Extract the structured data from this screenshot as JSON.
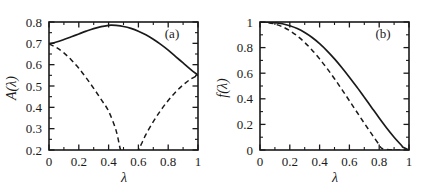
{
  "figure": {
    "panels": [
      "a",
      "b"
    ],
    "line_color": "#1a1a1a",
    "background": "#ffffff"
  },
  "panel_a": {
    "tag": "(a)",
    "xlabel": "λ",
    "ylabel": "A(λ)",
    "xticks": [
      "0",
      "0.2",
      "0.4",
      "0.6",
      "0.8",
      "1"
    ],
    "yticks": [
      "0.2",
      "0.3",
      "0.4",
      "0.5",
      "0.6",
      "0.7",
      "0.8"
    ]
  },
  "panel_b": {
    "tag": "(b)",
    "xlabel": "λ",
    "ylabel": "f(λ)",
    "xticks": [
      "0",
      "0.2",
      "0.4",
      "0.6",
      "0.8",
      "1"
    ],
    "yticks": [
      "0",
      "0.2",
      "0.4",
      "0.6",
      "0.8",
      "1"
    ]
  },
  "chart_data": [
    {
      "type": "line",
      "title": "(a)",
      "xlabel": "λ",
      "ylabel": "A(λ)",
      "xlim": [
        0,
        1
      ],
      "ylim": [
        0.2,
        0.8
      ],
      "xticks": [
        0,
        0.2,
        0.4,
        0.6,
        0.8,
        1
      ],
      "yticks": [
        0.2,
        0.3,
        0.4,
        0.5,
        0.6,
        0.7,
        0.8
      ],
      "grid": false,
      "legend": "none",
      "series": [
        {
          "name": "solid",
          "style": "solid",
          "x": [
            0,
            0.05,
            0.1,
            0.15,
            0.2,
            0.25,
            0.3,
            0.35,
            0.4,
            0.42,
            0.45,
            0.5,
            0.55,
            0.6,
            0.65,
            0.7,
            0.75,
            0.8,
            0.85,
            0.9,
            0.95,
            1
          ],
          "y": [
            0.697,
            0.706,
            0.718,
            0.731,
            0.744,
            0.757,
            0.769,
            0.778,
            0.784,
            0.785,
            0.784,
            0.779,
            0.77,
            0.757,
            0.74,
            0.719,
            0.695,
            0.668,
            0.638,
            0.608,
            0.578,
            0.551
          ]
        },
        {
          "name": "dashed",
          "style": "dashed",
          "note": "clipped below axis minimum between lambda 0.48 and 0.60",
          "x": [
            0,
            0.05,
            0.1,
            0.15,
            0.2,
            0.25,
            0.3,
            0.35,
            0.4,
            0.45,
            0.48,
            0.5,
            0.54,
            0.6,
            0.62,
            0.65,
            0.7,
            0.75,
            0.8,
            0.85,
            0.9,
            0.95,
            1
          ],
          "y": [
            0.697,
            0.68,
            0.655,
            0.622,
            0.583,
            0.538,
            0.489,
            0.437,
            0.382,
            0.292,
            0.2,
            0.175,
            0.165,
            0.2,
            0.228,
            0.272,
            0.333,
            0.386,
            0.432,
            0.472,
            0.505,
            0.532,
            0.551
          ]
        }
      ]
    },
    {
      "type": "line",
      "title": "(b)",
      "xlabel": "λ",
      "ylabel": "f(λ)",
      "xlim": [
        0,
        1
      ],
      "ylim": [
        0,
        1
      ],
      "xticks": [
        0,
        0.2,
        0.4,
        0.6,
        0.8,
        1
      ],
      "yticks": [
        0,
        0.2,
        0.4,
        0.6,
        0.8,
        1
      ],
      "grid": false,
      "legend": "none",
      "series": [
        {
          "name": "solid",
          "style": "solid",
          "x": [
            0,
            0.05,
            0.1,
            0.15,
            0.2,
            0.25,
            0.3,
            0.35,
            0.4,
            0.45,
            0.5,
            0.55,
            0.6,
            0.65,
            0.7,
            0.75,
            0.8,
            0.85,
            0.9,
            0.95,
            0.96,
            1
          ],
          "y": [
            1.0,
            0.999,
            0.995,
            0.986,
            0.971,
            0.949,
            0.918,
            0.879,
            0.831,
            0.775,
            0.712,
            0.643,
            0.569,
            0.492,
            0.412,
            0.331,
            0.25,
            0.172,
            0.1,
            0.035,
            0.022,
            0.0
          ]
        },
        {
          "name": "dashed",
          "style": "dashed",
          "x": [
            0,
            0.05,
            0.1,
            0.15,
            0.2,
            0.25,
            0.3,
            0.35,
            0.4,
            0.45,
            0.5,
            0.55,
            0.6,
            0.65,
            0.7,
            0.75,
            0.8,
            0.82,
            0.9,
            1
          ],
          "y": [
            1.0,
            0.996,
            0.984,
            0.963,
            0.932,
            0.891,
            0.84,
            0.78,
            0.712,
            0.637,
            0.557,
            0.472,
            0.385,
            0.297,
            0.209,
            0.124,
            0.041,
            0.012,
            0.0,
            0.0
          ]
        }
      ]
    }
  ]
}
